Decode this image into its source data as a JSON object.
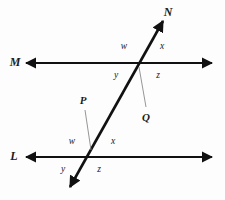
{
  "figure": {
    "background_color": "#fdfdfd",
    "stroke_color": "#111111",
    "leader_color": "#8a8a8a",
    "width": 225,
    "height": 200
  },
  "lines": {
    "m": {
      "label": "M",
      "label_x": 15,
      "label_y": 62,
      "y": 63,
      "x1": 26,
      "x2": 212,
      "stroke_width": 2.2
    },
    "l": {
      "label": "L",
      "label_x": 14,
      "label_y": 156,
      "y": 157,
      "x1": 26,
      "x2": 212,
      "stroke_width": 2.2
    },
    "transversal": {
      "label": "N",
      "label_x": 168,
      "label_y": 12,
      "x1": 163,
      "y1": 21,
      "x2": 70,
      "y2": 187,
      "stroke_width": 2.6
    }
  },
  "points": [
    {
      "name": "Q",
      "label": "Q",
      "label_x": 146,
      "label_y": 117,
      "x": 140,
      "y": 63,
      "leader_x1": 139,
      "leader_y1": 67,
      "leader_x2": 146,
      "leader_y2": 107
    },
    {
      "name": "P",
      "label": "P",
      "label_x": 83,
      "label_y": 100,
      "x": 90,
      "y": 157,
      "leader_x1": 85,
      "leader_y1": 110,
      "leader_x2": 91,
      "leader_y2": 150
    }
  ],
  "angles": [
    {
      "id": "q-w",
      "label": "w",
      "x": 124,
      "y": 47,
      "vertex": "Q",
      "quadrant": "upper-left"
    },
    {
      "id": "q-x",
      "label": "x",
      "x": 162,
      "y": 47,
      "vertex": "Q",
      "quadrant": "upper-right"
    },
    {
      "id": "q-y",
      "label": "y",
      "x": 116,
      "y": 76,
      "vertex": "Q",
      "quadrant": "lower-left"
    },
    {
      "id": "q-z",
      "label": "z",
      "x": 158,
      "y": 76,
      "vertex": "Q",
      "quadrant": "lower-right"
    },
    {
      "id": "p-w",
      "label": "w",
      "x": 72,
      "y": 142,
      "vertex": "P",
      "quadrant": "upper-left"
    },
    {
      "id": "p-x",
      "label": "x",
      "x": 113,
      "y": 142,
      "vertex": "P",
      "quadrant": "upper-right"
    },
    {
      "id": "p-y",
      "label": "y",
      "x": 63,
      "y": 170,
      "vertex": "P",
      "quadrant": "lower-left"
    },
    {
      "id": "p-z",
      "label": "z",
      "x": 99,
      "y": 170,
      "vertex": "P",
      "quadrant": "lower-right"
    }
  ]
}
